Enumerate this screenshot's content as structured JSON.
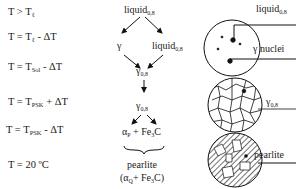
{
  "conditions": [
    {
      "pre": "T > T",
      "sub": "ℓ",
      "post": ""
    },
    {
      "pre": "T = T",
      "sub": "ℓ",
      "post": " - ΔT"
    },
    {
      "pre": "T = T",
      "sub": "Sol",
      "post": " - ΔT"
    },
    {
      "pre": "T = T",
      "sub": "PSK",
      "post": " + ΔT"
    },
    {
      "pre": "T = T",
      "sub": "PSK",
      "post": " - ΔT"
    },
    {
      "pre": "T = 20 ºC",
      "sub": "",
      "post": ""
    }
  ],
  "flow": {
    "liquid_top": {
      "main": "liquid",
      "sub": "0,8"
    },
    "gamma": {
      "main": "γ"
    },
    "liquid_right": {
      "main": "liquid",
      "sub": "0,8"
    },
    "gamma_08_a": {
      "main": "γ",
      "sub": "0,8"
    },
    "gamma_08_b": {
      "main": "γ",
      "sub": "0,8"
    },
    "alpha_fe3c": {
      "a": "α",
      "asub": "P",
      "b": " + Fe",
      "bsub": "3",
      "c": "C"
    },
    "pearlite": "pearlite",
    "pearlite_formula": {
      "a": "(α",
      "asub": "Q",
      "b": "+ Fe",
      "bsub": "3",
      "c": "C)"
    }
  },
  "micro_labels": {
    "liquid": {
      "main": "liquid",
      "sub": "0,8"
    },
    "gamma_nuclei": "γ nuclei",
    "gamma": {
      "main": "γ",
      "sub": "0,8"
    },
    "pearlite": "pearlite"
  }
}
